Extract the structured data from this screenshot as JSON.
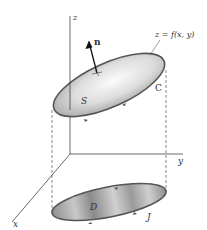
{
  "labels": {
    "z_axis": "z",
    "y_axis": "y",
    "x_axis": "x",
    "normal": "n",
    "surface_eq": "z = f(x, y)",
    "surface": "S",
    "boundary_curve": "C",
    "region": "D",
    "projected_curve": "J"
  },
  "colors": {
    "outline": "#555555",
    "surface_fill_light": "#f2f2f2",
    "surface_fill_dark": "#a9a9a9",
    "region_fill_light": "#d6d6d6",
    "region_fill_dark": "#8c8c8c",
    "axis": "#444444"
  }
}
